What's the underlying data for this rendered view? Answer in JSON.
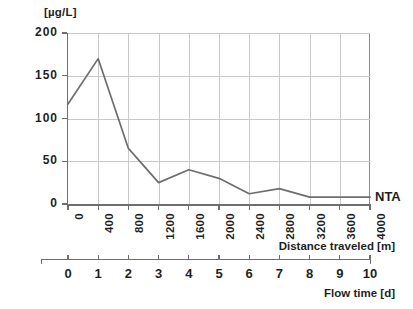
{
  "chart_data": {
    "type": "line",
    "title": "",
    "unit_label": "[µg/L]",
    "ylabel": "",
    "xlabel": "Distance traveled [m]",
    "secondary_xlabel": "Flow time [d]",
    "ylim": [
      0,
      200
    ],
    "yticks": [
      0,
      50,
      100,
      150,
      200
    ],
    "ytick_labels": [
      "0",
      "50",
      "100",
      "150",
      "200"
    ],
    "xlim": [
      0,
      4000
    ],
    "xticks": [
      0,
      400,
      800,
      1200,
      1600,
      2000,
      2400,
      2800,
      3200,
      3600,
      4000
    ],
    "xtick_labels": [
      "0",
      "400",
      "800",
      "1200",
      "1600",
      "2000",
      "2400",
      "2800",
      "3200",
      "3600",
      "4000"
    ],
    "secondary_xticks": [
      0,
      1,
      2,
      3,
      4,
      5,
      6,
      7,
      8,
      9,
      10
    ],
    "secondary_xtick_labels": [
      "0",
      "1",
      "2",
      "3",
      "4",
      "5",
      "6",
      "7",
      "8",
      "9",
      "10"
    ],
    "grid": true,
    "legend_position": "right-inline",
    "series": [
      {
        "name": "NTA",
        "color": "#6e6e6e",
        "x": [
          0,
          400,
          800,
          1200,
          1600,
          2000,
          2400,
          2800,
          3200,
          3600,
          4000
        ],
        "values": [
          117,
          170,
          65,
          25,
          40,
          30,
          12,
          18,
          8,
          8,
          8
        ]
      }
    ]
  },
  "legend": {
    "nta_label": "NTA"
  }
}
